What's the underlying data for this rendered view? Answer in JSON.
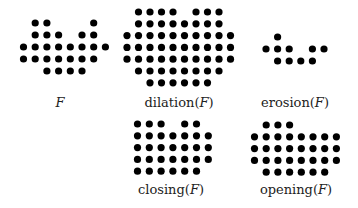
{
  "figure": {
    "dot_color": "#000000",
    "panels": [
      {
        "id": "F",
        "label_main": "",
        "label_var": "F",
        "rows": [
          [
            1,
            2,
            6
          ],
          [
            1,
            2,
            3,
            5,
            6
          ],
          [
            0,
            1,
            2,
            3,
            4,
            5,
            6,
            7
          ],
          [
            0,
            1,
            2,
            3,
            4,
            5,
            6
          ],
          [
            2,
            3,
            4,
            5
          ]
        ]
      },
      {
        "id": "dilation",
        "label_main": "dilation(",
        "label_var": "F",
        "label_close": ")",
        "rows": [
          [
            1,
            2,
            3,
            4,
            6,
            7,
            8
          ],
          [
            1,
            2,
            3,
            4,
            5,
            6,
            7,
            8
          ],
          [
            0,
            1,
            2,
            3,
            4,
            5,
            6,
            7,
            8,
            9
          ],
          [
            0,
            1,
            2,
            3,
            4,
            5,
            6,
            7,
            8,
            9
          ],
          [
            0,
            1,
            2,
            3,
            4,
            5,
            6,
            7,
            8,
            9
          ],
          [
            1,
            2,
            3,
            4,
            5,
            6,
            7,
            8
          ],
          [
            2,
            3,
            4,
            5,
            6,
            7
          ]
        ]
      },
      {
        "id": "erosion",
        "label_main": "erosion(",
        "label_var": "F",
        "label_close": ")",
        "rows": [
          [
            1
          ],
          [
            0,
            1,
            2,
            4,
            5
          ],
          [
            1,
            2,
            3,
            4
          ]
        ]
      },
      {
        "id": "closing",
        "label_main": "closing(",
        "label_var": "F",
        "label_close": ")",
        "rows": [
          [
            0,
            1,
            2,
            4,
            5
          ],
          [
            0,
            1,
            2,
            3,
            4,
            5,
            6
          ],
          [
            0,
            1,
            2,
            3,
            4,
            5,
            6
          ],
          [
            0,
            1,
            2,
            3,
            4,
            5,
            6
          ],
          [
            0,
            1,
            2,
            3,
            4,
            5
          ]
        ]
      },
      {
        "id": "opening",
        "label_main": "opening(",
        "label_var": "F",
        "label_close": ")",
        "rows": [
          [
            1,
            2,
            3
          ],
          [
            0,
            1,
            2,
            3,
            4,
            5,
            6,
            7
          ],
          [
            0,
            1,
            2,
            3,
            4,
            5,
            6,
            7
          ],
          [
            0,
            1,
            2,
            3,
            4,
            5,
            6,
            7
          ],
          [
            1,
            2,
            3,
            4,
            5,
            6
          ]
        ]
      }
    ]
  }
}
